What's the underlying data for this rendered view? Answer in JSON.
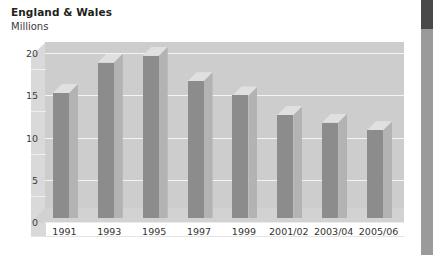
{
  "chart_data": {
    "type": "bar",
    "title": "England & Wales",
    "subtitle": "Millions",
    "xlabel": "",
    "ylabel": "Millions",
    "ylim": [
      0,
      20
    ],
    "yticks": [
      0,
      5,
      10,
      15,
      20
    ],
    "ytick_labels": [
      "0",
      "5",
      "10",
      "15",
      "20"
    ],
    "grid": true,
    "legend": false,
    "style": "3d-bar",
    "categories": [
      "1991",
      "1993",
      "1995",
      "1997",
      "1999",
      "2001/02",
      "2003/04",
      "2005/06"
    ],
    "values": [
      14.8,
      18.4,
      19.2,
      16.2,
      14.5,
      12.2,
      11.3,
      10.4
    ],
    "series": [
      {
        "name": "England & Wales",
        "values": [
          14.8,
          18.4,
          19.2,
          16.2,
          14.5,
          12.2,
          11.3,
          10.4
        ]
      }
    ]
  },
  "colors": {
    "bar_front": "#8c8c8c",
    "bar_side": "#b3b3b3",
    "bar_top": "#e0e0e0",
    "plot_background": "#cdcdcd",
    "floor": "#d2d2d2",
    "gridline": "#f4f4f4",
    "accent": "#9a9a9a",
    "accent_cap": "#494949",
    "title_text": "#231f20"
  },
  "accent": {
    "name": "right-edge-accent-bar"
  }
}
